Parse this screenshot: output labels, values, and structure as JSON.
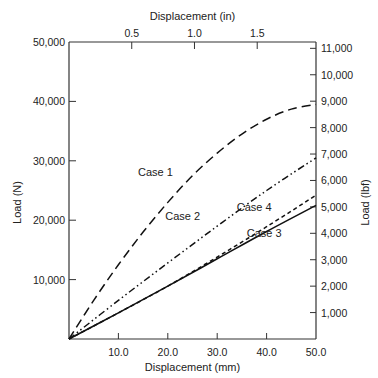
{
  "chart_data": {
    "type": "line",
    "title": "",
    "xlabel": "Displacement (mm)",
    "ylabel": "Load (N)",
    "x2label": "Displacement (in)",
    "y2label": "Load (lbf)",
    "xlim": [
      0,
      50
    ],
    "ylim": [
      0,
      50000
    ],
    "x2lim": [
      0,
      1.9685
    ],
    "y2lim": [
      0,
      11240
    ],
    "x_ticks": [
      10.0,
      20.0,
      30.0,
      40.0,
      50.0
    ],
    "x_tick_labels": [
      "10.0",
      "20.0",
      "30.0",
      "40.0",
      "50.0"
    ],
    "y_ticks": [
      10000,
      20000,
      30000,
      40000,
      50000
    ],
    "y_tick_labels": [
      "10,000",
      "20,000",
      "30,000",
      "40,000",
      "50,000"
    ],
    "x2_ticks": [
      0.5,
      1.0,
      1.5
    ],
    "x2_tick_labels": [
      "0.5",
      "1.0",
      "1.5"
    ],
    "y2_ticks": [
      1000,
      2000,
      3000,
      4000,
      5000,
      6000,
      7000,
      8000,
      9000,
      10000,
      11000
    ],
    "y2_tick_labels": [
      "1,000",
      "2,000",
      "3,000",
      "4,000",
      "5,000",
      "6,000",
      "7,000",
      "8,000",
      "9,000",
      "10,000",
      "11,000"
    ],
    "grid": false,
    "legend": "inline annotations",
    "series": [
      {
        "name": "Case 1",
        "style": "long-dash",
        "x": [
          0,
          5,
          10,
          15,
          20,
          25,
          30,
          35,
          40,
          45,
          50
        ],
        "values": [
          0,
          6500,
          12500,
          18000,
          23000,
          27500,
          31300,
          34500,
          37000,
          38700,
          39500
        ]
      },
      {
        "name": "Case 2",
        "style": "dash-dot-dot",
        "x": [
          0,
          10,
          20,
          30,
          40,
          50
        ],
        "values": [
          0,
          6500,
          12800,
          19000,
          25000,
          30500
        ]
      },
      {
        "name": "Case 3",
        "style": "solid",
        "x": [
          0,
          10,
          20,
          30,
          40,
          50
        ],
        "values": [
          0,
          4400,
          8900,
          13500,
          18100,
          22500
        ]
      },
      {
        "name": "Case 4",
        "style": "short-dash",
        "x": [
          0,
          10,
          20,
          30,
          40,
          50
        ],
        "values": [
          0,
          4400,
          8900,
          13800,
          18900,
          24200
        ]
      }
    ],
    "annotations": [
      {
        "text": "Case 1",
        "x": 17.5,
        "y": 27500
      },
      {
        "text": "Case 2",
        "x": 23,
        "y": 20000
      },
      {
        "text": "Case 4",
        "x": 37.5,
        "y": 21500
      },
      {
        "text": "Case 3",
        "x": 39.5,
        "y": 17200
      }
    ]
  }
}
